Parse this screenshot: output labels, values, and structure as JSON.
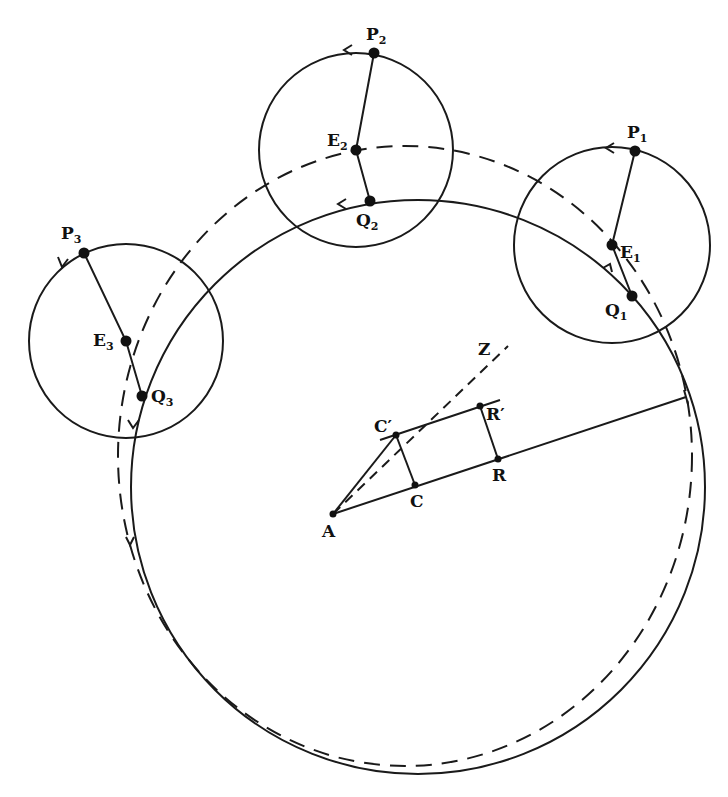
{
  "diagram": {
    "type": "epicycle-geometry",
    "stroke_color": "#1a1a1a",
    "background": "#ffffff",
    "deferent_solid": {
      "label": "path of Q",
      "cx": 418,
      "cy": 487,
      "r": 287
    },
    "deferent_dashed": {
      "label": "path of E",
      "cx": 405,
      "cy": 456,
      "rx": 287,
      "ry": 310
    },
    "epicycles": [
      {
        "id": "1",
        "cx": 612,
        "cy": 245,
        "r": 98,
        "P": {
          "label": "P",
          "sub": "1",
          "x": 635,
          "y": 151
        },
        "E": {
          "label": "E",
          "sub": "1",
          "x": 612,
          "y": 245
        },
        "Q": {
          "label": "Q",
          "sub": "1",
          "x": 632,
          "y": 296
        }
      },
      {
        "id": "2",
        "cx": 356,
        "cy": 150,
        "r": 97,
        "P": {
          "label": "P",
          "sub": "2",
          "x": 374,
          "y": 53
        },
        "E": {
          "label": "E",
          "sub": "2",
          "x": 356,
          "y": 150
        },
        "Q": {
          "label": "Q",
          "sub": "2",
          "x": 370,
          "y": 201
        }
      },
      {
        "id": "3",
        "cx": 126,
        "cy": 341,
        "r": 97,
        "P": {
          "label": "P",
          "sub": "3",
          "x": 84,
          "y": 253
        },
        "E": {
          "label": "E",
          "sub": "3",
          "x": 126,
          "y": 341
        },
        "Q": {
          "label": "Q",
          "sub": "3",
          "x": 142,
          "y": 396
        }
      }
    ],
    "construction": {
      "A": {
        "label": "A",
        "x": 333,
        "y": 514
      },
      "C": {
        "label": "C",
        "x": 415,
        "y": 485
      },
      "C_prime": {
        "label": "C′",
        "x": 396,
        "y": 435
      },
      "R": {
        "label": "R",
        "x": 498,
        "y": 459
      },
      "R_prime": {
        "label": "R′",
        "x": 480,
        "y": 406
      },
      "Z": {
        "label": "Z",
        "x": 487,
        "y": 352
      },
      "ray_end": {
        "x": 686,
        "y": 397
      }
    }
  },
  "labels": {
    "P1": "P",
    "P1_sub": "1",
    "P2": "P",
    "P2_sub": "2",
    "P3": "P",
    "P3_sub": "3",
    "E1": "E",
    "E1_sub": "1",
    "E2": "E",
    "E2_sub": "2",
    "E3": "E",
    "E3_sub": "3",
    "Q1": "Q",
    "Q1_sub": "1",
    "Q2": "Q",
    "Q2_sub": "2",
    "Q3": "Q",
    "Q3_sub": "3",
    "A": "A",
    "C": "C",
    "C_prime": "C′",
    "R": "R",
    "R_prime": "R′",
    "Z": "Z"
  }
}
